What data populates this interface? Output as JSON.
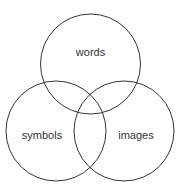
{
  "diagram": {
    "type": "venn",
    "stroke_color": "#333333",
    "sets": [
      {
        "label": "words",
        "cx": 90.5,
        "cy": 64,
        "r": 50,
        "label_x": 90.5,
        "label_y": 56
      },
      {
        "label": "symbols",
        "cx": 56,
        "cy": 131,
        "r": 50,
        "label_x": 42,
        "label_y": 139
      },
      {
        "label": "images",
        "cx": 124,
        "cy": 131,
        "r": 50,
        "label_x": 136,
        "label_y": 139
      }
    ]
  }
}
